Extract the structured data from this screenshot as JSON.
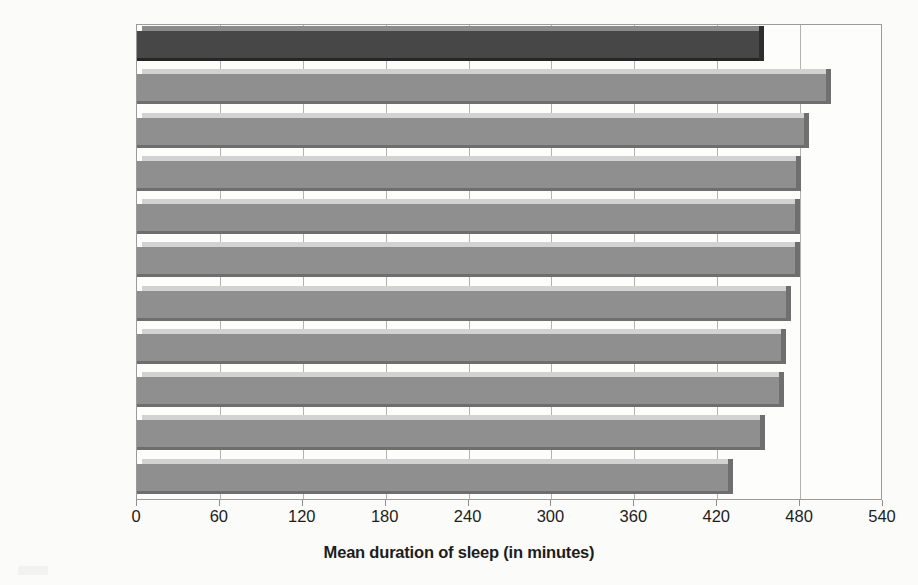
{
  "chart_data": {
    "type": "bar",
    "orientation": "horizontal",
    "title": "",
    "xlabel": "Mean duration of sleep (in minutes)",
    "ylabel": "",
    "xlim": [
      0,
      540
    ],
    "xticks": [
      0,
      60,
      120,
      180,
      240,
      300,
      360,
      420,
      480,
      540
    ],
    "xtick_labels": [
      "0",
      "60",
      "120",
      "180",
      "240",
      "300",
      "360",
      "420",
      "480",
      "540"
    ],
    "grid": "vertical",
    "legend": "none",
    "categories": [
      "All countries",
      "Portugal",
      "China",
      "Austria",
      "Belgium",
      "Spain",
      "Slovakia",
      "South Africa",
      "Brazil",
      "Germany",
      "Japan"
    ],
    "values": [
      450,
      499,
      483,
      477,
      476,
      476,
      470,
      466,
      465,
      451,
      428
    ],
    "bars": [
      {
        "category": "All countries",
        "value": 450,
        "highlight": true,
        "color": "#474747"
      },
      {
        "category": "Portugal",
        "value": 499,
        "highlight": false,
        "color": "#8f8f8f"
      },
      {
        "category": "China",
        "value": 483,
        "highlight": false,
        "color": "#8f8f8f"
      },
      {
        "category": "Austria",
        "value": 477,
        "highlight": false,
        "color": "#8f8f8f"
      },
      {
        "category": "Belgium",
        "value": 476,
        "highlight": false,
        "color": "#8f8f8f"
      },
      {
        "category": "Spain",
        "value": 476,
        "highlight": false,
        "color": "#8f8f8f"
      },
      {
        "category": "Slovakia",
        "value": 470,
        "highlight": false,
        "color": "#8f8f8f"
      },
      {
        "category": "South Africa",
        "value": 466,
        "highlight": false,
        "color": "#8f8f8f"
      },
      {
        "category": "Brazil",
        "value": 465,
        "highlight": false,
        "color": "#8f8f8f"
      },
      {
        "category": "Germany",
        "value": 451,
        "highlight": false,
        "color": "#8f8f8f"
      },
      {
        "category": "Japan",
        "value": 428,
        "highlight": false,
        "color": "#8f8f8f"
      }
    ],
    "colors": {
      "highlight_bar": "#474747",
      "bar": "#8f8f8f",
      "bar_shadow": "#6e6e6e",
      "bar_top": "#d2d2d2",
      "plot_border": "#9b9b9b",
      "gridline": "#b2b2b2",
      "background": "#fbfbfa",
      "text": "#1d1d1b"
    }
  }
}
